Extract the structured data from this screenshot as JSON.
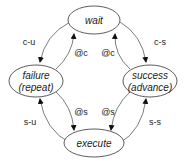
{
  "nodes": {
    "wait": {
      "label": "wait"
    },
    "failure": {
      "label1": "failure",
      "label2": "(repeat)"
    },
    "success": {
      "label1": "success",
      "label2": "(advance)"
    },
    "execute": {
      "label": "execute"
    }
  },
  "edges": {
    "wait_to_failure": "c-u",
    "wait_to_success": "c-s",
    "failure_to_wait": "@c",
    "success_to_wait": "@c",
    "failure_to_execute": "@s",
    "success_to_execute": "@s",
    "execute_to_failure": "s-u",
    "execute_to_success": "s-s"
  }
}
